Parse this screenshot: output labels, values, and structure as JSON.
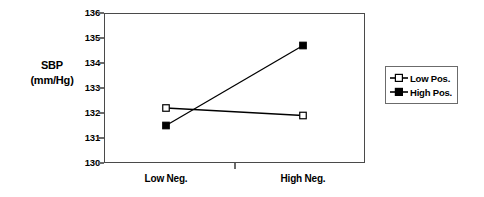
{
  "chart_data": {
    "type": "line",
    "title": "",
    "xlabel": "",
    "ylabel": "SBP (mm/Hg)",
    "ylabel_line1": "SBP",
    "ylabel_line2": "(mm/Hg)",
    "categories": [
      "Low Neg.",
      "High Neg."
    ],
    "ylim": [
      130,
      136
    ],
    "ytick_labels": [
      "136",
      "135",
      "134",
      "133",
      "132",
      "131",
      "130"
    ],
    "ytick_values": [
      136,
      135,
      134,
      133,
      132,
      131,
      130
    ],
    "grid": true,
    "grid_axis": "y",
    "legend_position": "right",
    "series": [
      {
        "name": "Low Pos.",
        "marker": "open-square",
        "values": [
          132.2,
          131.9
        ]
      },
      {
        "name": "High Pos.",
        "marker": "filled-square",
        "values": [
          131.5,
          134.7
        ]
      }
    ],
    "colors": {
      "line": "#000000",
      "grid": "#6b6b6b",
      "frame": "#4a4a4a",
      "marker_fill_open": "#ffffff",
      "marker_fill_closed": "#000000"
    }
  },
  "legend": {
    "items": [
      {
        "label": "Low Pos.",
        "marker": "open-square"
      },
      {
        "label": "High Pos.",
        "marker": "filled-square"
      }
    ]
  }
}
